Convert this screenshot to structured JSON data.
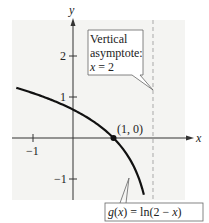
{
  "chart_data": {
    "type": "line",
    "title": "",
    "xlabel": "x",
    "ylabel": "y",
    "xlim": [
      -1.4,
      2.3
    ],
    "ylim": [
      -1.5,
      2.9
    ],
    "grid": false,
    "x_ticks": [
      -1
    ],
    "x_tick_labels": [
      "-1"
    ],
    "y_ticks": [
      -1,
      1,
      2
    ],
    "y_tick_labels": [
      "-1",
      "1",
      "2"
    ],
    "series": [
      {
        "name": "g(x) = ln(2 − x)",
        "function": "ln(2 - x)",
        "x": [
          -1.4,
          -1.0,
          -0.5,
          0.0,
          0.5,
          1.0,
          1.25,
          1.5,
          1.65,
          1.75
        ],
        "values": [
          1.22,
          1.1,
          0.92,
          0.69,
          0.41,
          0.0,
          -0.29,
          -0.69,
          -1.05,
          -1.39
        ]
      }
    ],
    "points": [
      {
        "x": 1,
        "y": 0,
        "label": "(1, 0)"
      }
    ],
    "asymptotes": [
      {
        "type": "vertical",
        "x": 2,
        "style": "dashed"
      }
    ],
    "annotations": [
      {
        "text": [
          "Vertical",
          "asymptote:",
          "x = 2"
        ],
        "target": "asymptote x=2"
      },
      {
        "text": "g(x) = ln(2 − x)",
        "target": "curve"
      }
    ]
  },
  "labels": {
    "x_axis": "x",
    "y_axis": "y",
    "tick_neg1_x": "−1",
    "tick_1_y": "1",
    "tick_2_y": "2",
    "tick_neg1_y": "−1",
    "point": "(1, 0)",
    "asym_line1": "Vertical",
    "asym_line2": "asymptote:",
    "asym_line3_var": "x",
    "asym_line3_rest": " = 2",
    "func_g": "g",
    "func_paren_x1": "(",
    "func_x1": "x",
    "func_mid": ") = ln(2 − ",
    "func_x2": "x",
    "func_end": ")"
  },
  "colors": {
    "background_panel": "#f4f4f2",
    "axis": "#333333",
    "curve": "#111111",
    "asymptote": "#a9a9a9",
    "callout_border": "#666666"
  }
}
